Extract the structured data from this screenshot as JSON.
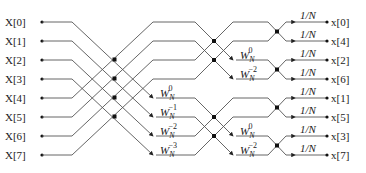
{
  "diagram": {
    "type": "8-point inverse FFT butterfly (decimation in frequency)",
    "inputs": [
      "X[0]",
      "X[1]",
      "X[2]",
      "X[3]",
      "X[4]",
      "X[5]",
      "X[6]",
      "X[7]"
    ],
    "outputs": [
      "x[0]",
      "x[4]",
      "x[2]",
      "x[6]",
      "x[1]",
      "x[5]",
      "x[3]",
      "x[7]"
    ],
    "stage1_twiddles": [
      {
        "base": "W",
        "sub": "N",
        "sup": "0"
      },
      {
        "base": "W",
        "sub": "N",
        "sup": "−1"
      },
      {
        "base": "W",
        "sub": "N",
        "sup": "−2"
      },
      {
        "base": "W",
        "sub": "N",
        "sup": "−3"
      }
    ],
    "stage2_twiddles": [
      {
        "base": "W",
        "sub": "N",
        "sup": "0"
      },
      {
        "base": "W",
        "sub": "N",
        "sup": "−2"
      },
      {
        "base": "W",
        "sub": "N",
        "sup": "0"
      },
      {
        "base": "W",
        "sub": "N",
        "sup": "−2"
      }
    ],
    "scale_label": "1/N",
    "scale_labels": [
      "1/N",
      "1/N",
      "1/N",
      "1/N",
      "1/N",
      "1/N",
      "1/N",
      "1/N"
    ]
  }
}
